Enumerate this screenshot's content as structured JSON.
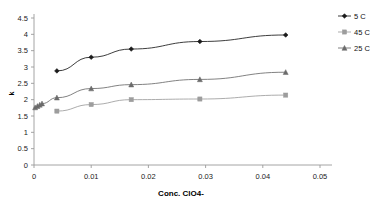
{
  "chart_data": {
    "type": "line",
    "title": "",
    "xlabel": "Conc. ClO4-",
    "ylabel": "k",
    "xlim": [
      0,
      0.05
    ],
    "ylim": [
      0,
      4.5
    ],
    "xticks": [
      "0",
      "0.01",
      "0.02",
      "0.03",
      "0.04",
      "0.05"
    ],
    "xtick_values": [
      0,
      0.01,
      0.02,
      0.03,
      0.04,
      0.05
    ],
    "yticks": [
      "0",
      "0.5",
      "1",
      "1.5",
      "2",
      "2.5",
      "3",
      "3.5",
      "4",
      "4.5"
    ],
    "ytick_values": [
      0,
      0.5,
      1,
      1.5,
      2,
      2.5,
      3,
      3.5,
      4,
      4.5
    ],
    "grid": false,
    "legend_position": "right-top",
    "series": [
      {
        "name": "5 C",
        "marker": "diamond",
        "color": "#1a1a1a",
        "x": [
          0.004,
          0.01,
          0.017,
          0.029,
          0.044
        ],
        "y": [
          2.88,
          3.3,
          3.55,
          3.78,
          3.98
        ]
      },
      {
        "name": "45 C",
        "marker": "square",
        "color": "#9d9d9d",
        "x": [
          0.004,
          0.01,
          0.017,
          0.029,
          0.044
        ],
        "y": [
          1.65,
          1.85,
          2.0,
          2.02,
          2.14
        ]
      },
      {
        "name": "25 C",
        "marker": "triangle",
        "color": "#6b6b6b",
        "x": [
          0.0002,
          0.0006,
          0.001,
          0.0014,
          0.004,
          0.01,
          0.017,
          0.029,
          0.044
        ],
        "y": [
          1.76,
          1.8,
          1.84,
          1.88,
          2.06,
          2.34,
          2.46,
          2.62,
          2.84
        ]
      }
    ]
  },
  "legend": {
    "items": [
      {
        "label": "5 C",
        "marker": "diamond",
        "color": "#1a1a1a"
      },
      {
        "label": "45 C",
        "marker": "square",
        "color": "#9d9d9d"
      },
      {
        "label": "25 C",
        "marker": "triangle",
        "color": "#6b6b6b"
      }
    ]
  },
  "axes": {
    "x_title": "Conc. ClO4-",
    "y_title": "k"
  }
}
